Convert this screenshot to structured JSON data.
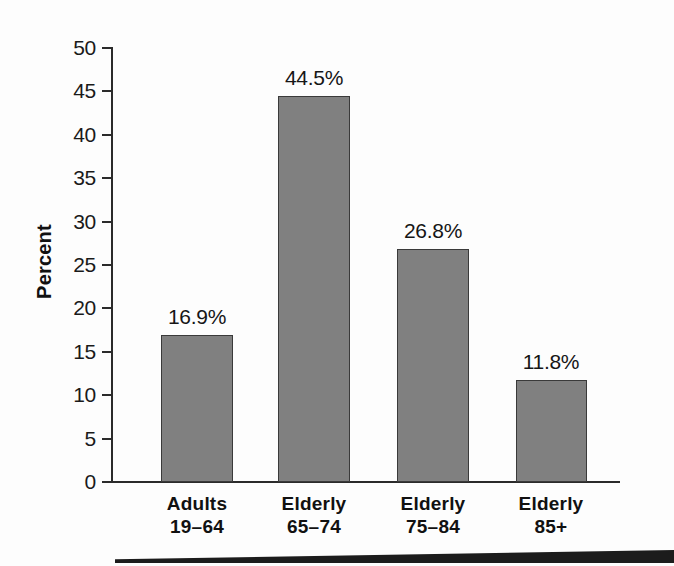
{
  "chart_data": {
    "type": "bar",
    "title": "",
    "subtitle": "",
    "xlabel": "",
    "ylabel": "Percent",
    "categories": [
      "Adults 19–64",
      "Elderly 65–74",
      "Elderly 75–84",
      "Elderly 85+"
    ],
    "category_lines": [
      {
        "line1": "Adults",
        "line2": "19–64"
      },
      {
        "line1": "Elderly",
        "line2": "65–74"
      },
      {
        "line1": "Elderly",
        "line2": "75–84"
      },
      {
        "line1": "Elderly",
        "line2": "85+"
      }
    ],
    "values": [
      16.9,
      44.5,
      26.8,
      11.8
    ],
    "value_labels": [
      "16.9%",
      "44.5%",
      "26.8%",
      "11.8%"
    ],
    "ylim": [
      0,
      50
    ],
    "yticks": [
      0,
      5,
      10,
      15,
      20,
      25,
      30,
      35,
      40,
      45,
      50
    ],
    "ytick_labels": [
      "0",
      "5",
      "10",
      "15",
      "20",
      "25",
      "30",
      "35",
      "40",
      "45",
      "50"
    ],
    "grid": false,
    "legend": null,
    "bar_color": "#808080",
    "bar_edge_color": "#3a3a3a",
    "axis_color": "#2b2b2b",
    "background_color": "#fdfdfd",
    "text_color": "#1a1a1a"
  },
  "decoration": {
    "bottom_rule_color": "#1c1c1c"
  }
}
